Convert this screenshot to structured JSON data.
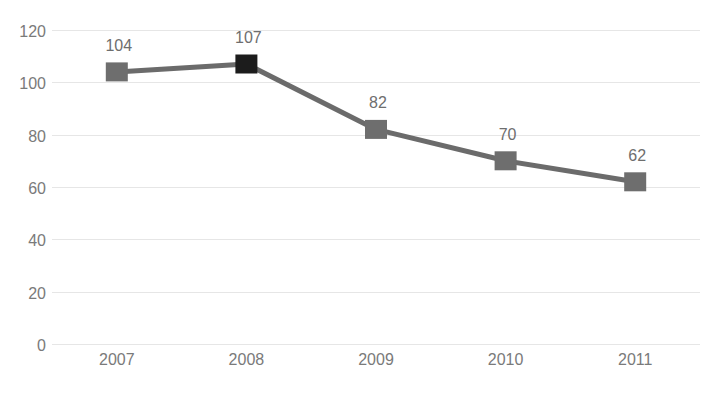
{
  "chart_data": {
    "type": "line",
    "title": "",
    "xlabel": "",
    "ylabel": "",
    "categories": [
      "2007",
      "2008",
      "2009",
      "2010",
      "2011"
    ],
    "values": [
      104,
      107,
      82,
      70,
      62
    ],
    "data_labels": [
      "104",
      "107",
      "82",
      "70",
      "62"
    ],
    "ylim": [
      0,
      120
    ],
    "yticks": [
      "120",
      "100",
      "80",
      "60",
      "40",
      "20",
      "0"
    ],
    "ytick_values": [
      120,
      100,
      80,
      60,
      40,
      20,
      0
    ],
    "grid": true,
    "legend": "none",
    "series": [
      {
        "name": "series-1",
        "values": [
          104,
          107,
          82,
          70,
          62
        ],
        "line_color": "#6b6b6b",
        "marker": "square",
        "marker_colors": [
          "#6e6e6e",
          "#1c1c1c",
          "#6e6e6e",
          "#6e6e6e",
          "#6e6e6e"
        ]
      }
    ],
    "colors": {
      "line": "#6b6b6b",
      "marker": "#6e6e6e",
      "marker_highlight": "#1c1c1c",
      "gridline": "#e6e6e6",
      "tick_label": "#7a7a7a",
      "data_label": "#6e6e6e",
      "background": "#ffffff"
    }
  }
}
